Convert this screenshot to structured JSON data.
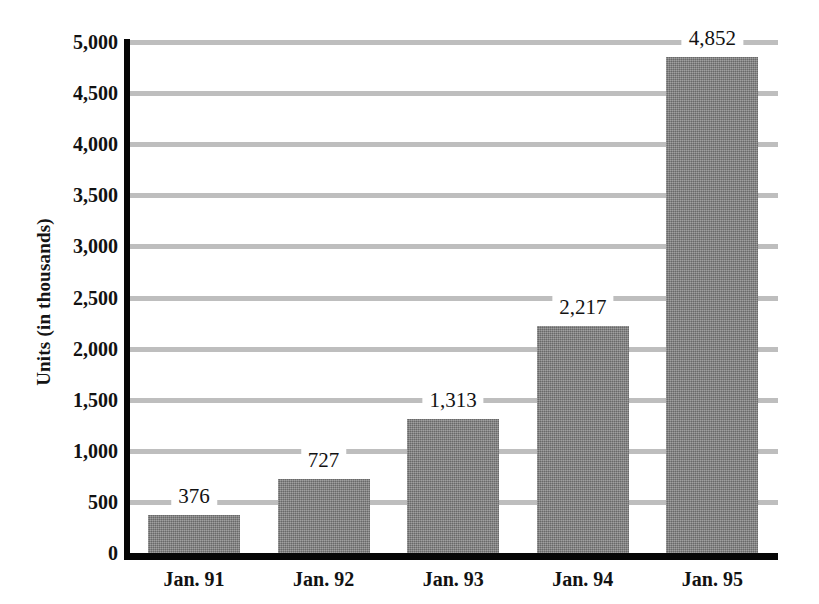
{
  "chart_data": {
    "type": "bar",
    "title": "",
    "xlabel": "",
    "ylabel": "Units (in thousands)",
    "categories": [
      "Jan. 91",
      "Jan. 92",
      "Jan. 93",
      "Jan. 94",
      "Jan. 95"
    ],
    "values": [
      376,
      727,
      1313,
      2217,
      4852
    ],
    "value_labels": [
      "376",
      "727",
      "1,313",
      "2,217",
      "4,852"
    ],
    "ylim": [
      0,
      5000
    ],
    "ytick_values": [
      0,
      500,
      1000,
      1500,
      2000,
      2500,
      3000,
      3500,
      4000,
      4500,
      5000
    ],
    "ytick_labels": [
      "0",
      "500",
      "1,000",
      "1,500",
      "2,000",
      "2,500",
      "3,000",
      "3,500",
      "4,000",
      "4,500",
      "5,000"
    ],
    "grid": true,
    "grid_axis": "y",
    "legend": false,
    "legend_position": "none",
    "bar_color": "#828282",
    "gridline_color": "#b9b9b9",
    "axis_color": "#060606",
    "background_color": "#ffffff",
    "series": [
      {
        "name": "Units",
        "values": [
          376,
          727,
          1313,
          2217,
          4852
        ]
      }
    ]
  }
}
